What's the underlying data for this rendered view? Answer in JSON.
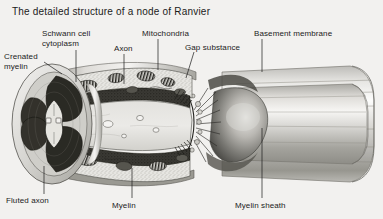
{
  "figure": {
    "title": "The detailed structure of a node of Ranvier",
    "background_color": "#f2f1ef",
    "ink_color": "#1b1b1b",
    "medium": "greyscale anatomical cutaway illustration"
  },
  "labels": [
    {
      "id": "crenated-myelin",
      "text": "Crenated\nmyelin",
      "x": 4,
      "y": 52,
      "align": "left"
    },
    {
      "id": "schwann-cell-cytoplasm",
      "text": "Schwann cell\ncytoplasm",
      "x": 42,
      "y": 29,
      "align": "left"
    },
    {
      "id": "axon",
      "text": "Axon",
      "x": 114,
      "y": 44,
      "align": "left"
    },
    {
      "id": "mitochondria",
      "text": "Mitochondria",
      "x": 142,
      "y": 29,
      "align": "left"
    },
    {
      "id": "gap-substance",
      "text": "Gap substance",
      "x": 185,
      "y": 43,
      "align": "left"
    },
    {
      "id": "basement-membrane",
      "text": "Basement membrane",
      "x": 254,
      "y": 29,
      "align": "left"
    },
    {
      "id": "fluted-axon",
      "text": "Fluted axon",
      "x": 6,
      "y": 196,
      "align": "left"
    },
    {
      "id": "myelin",
      "text": "Myelin",
      "x": 112,
      "y": 201,
      "align": "left"
    },
    {
      "id": "myelin-sheath",
      "text": "Myelin sheath",
      "x": 235,
      "y": 201,
      "align": "left"
    }
  ],
  "leader_lines": [
    {
      "id": "leader-crenated-myelin",
      "from": [
        44,
        62
      ],
      "to": [
        62,
        74
      ]
    },
    {
      "id": "leader-schwann-cytoplasm",
      "from": [
        76,
        50
      ],
      "to": [
        76,
        82
      ]
    },
    {
      "id": "leader-axon",
      "from": [
        124,
        54
      ],
      "to": [
        124,
        84
      ]
    },
    {
      "id": "leader-mitochondria",
      "from": [
        158,
        39
      ],
      "to": [
        158,
        70
      ]
    },
    {
      "id": "leader-gap-substance",
      "from": [
        194,
        52
      ],
      "to": [
        186,
        78
      ]
    },
    {
      "id": "leader-basement-membrane",
      "from": [
        262,
        39
      ],
      "to": [
        262,
        72
      ]
    },
    {
      "id": "leader-fluted-axon",
      "from": [
        44,
        194
      ],
      "to": [
        44,
        166
      ]
    },
    {
      "id": "leader-myelin",
      "from": [
        132,
        198
      ],
      "to": [
        132,
        168
      ]
    },
    {
      "id": "leader-myelin-sheath",
      "from": [
        262,
        198
      ],
      "to": [
        262,
        128
      ]
    }
  ],
  "anatomy": {
    "node_of_ranvier_center_x": 205,
    "left_segment": "cut myelinated internode showing fluted axon cross-section",
    "right_segment": "intact myelin sheath cylinder with basement membrane",
    "organelles": [
      "mitochondria",
      "schwann cell cytoplasm",
      "axoplasm"
    ]
  }
}
